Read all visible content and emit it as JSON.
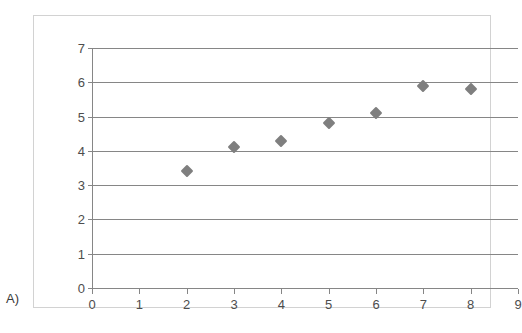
{
  "panel": {
    "label": "A)"
  },
  "chart_data": {
    "type": "scatter",
    "title": "",
    "subtitle": "",
    "xlabel": "",
    "ylabel": "",
    "xlim": [
      0,
      9
    ],
    "ylim": [
      0,
      7
    ],
    "grid": "horizontal",
    "legend": "none",
    "marker": {
      "shape": "diamond",
      "color": "#7f7f7f",
      "size": 9
    },
    "x": [
      2,
      3,
      4,
      5,
      6,
      7,
      8
    ],
    "y": [
      3.4,
      4.1,
      4.3,
      4.8,
      5.1,
      5.9,
      5.8
    ],
    "points": [
      {
        "x": 2,
        "y": 3.4
      },
      {
        "x": 3,
        "y": 4.1
      },
      {
        "x": 4,
        "y": 4.3
      },
      {
        "x": 5,
        "y": 4.8
      },
      {
        "x": 6,
        "y": 5.1
      },
      {
        "x": 7,
        "y": 5.9
      },
      {
        "x": 8,
        "y": 5.8
      }
    ],
    "xticklabels": [
      "0",
      "1",
      "2",
      "3",
      "4",
      "5",
      "6",
      "7",
      "8",
      "9"
    ],
    "yticklabels": [
      "0",
      "1",
      "2",
      "3",
      "4",
      "5",
      "6",
      "7"
    ],
    "xticks": [
      0,
      1,
      2,
      3,
      4,
      5,
      6,
      7,
      8,
      9
    ],
    "yticks": [
      0,
      1,
      2,
      3,
      4,
      5,
      6,
      7
    ],
    "annotations": []
  },
  "colors": {
    "marker": "#7f7f7f",
    "gridline": "#868686",
    "axis": "#868686",
    "frame_border": "#d2d2d2",
    "tick_text": "#4d4d4d",
    "background": "#ffffff"
  }
}
